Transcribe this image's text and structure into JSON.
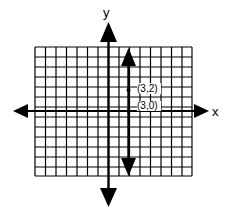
{
  "diagram": {
    "axis_labels": {
      "x": "x",
      "y": "y"
    },
    "points": [
      {
        "label": "(3,2)",
        "x": 3,
        "y": 2
      },
      {
        "label": "(3,0)",
        "x": 3,
        "y": 0
      }
    ],
    "line": {
      "description": "vertical line x = 3",
      "x": 3
    },
    "grid": {
      "columns": 15,
      "rows": 13
    }
  }
}
